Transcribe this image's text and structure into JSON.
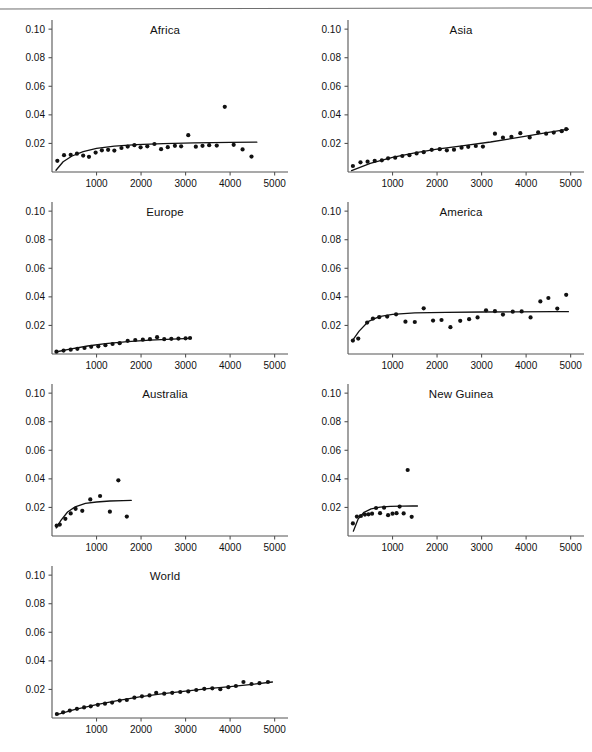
{
  "figure": {
    "layout": "2-column grid of small-multiple scatter plots, 7 panels",
    "panel_width": 296,
    "panel_height": 180
  },
  "axes": {
    "y_ticks": [
      "0.02",
      "0.04",
      "0.06",
      "0.08",
      "0.10"
    ],
    "y_tick_values": [
      0.02,
      0.04,
      0.06,
      0.08,
      0.1
    ],
    "x_ticks": [
      "1000",
      "2000",
      "3000",
      "4000",
      "5000"
    ],
    "x_tick_values": [
      1000,
      2000,
      3000,
      4000,
      5000
    ],
    "xlim": [
      0,
      5300
    ],
    "ylim": [
      0,
      0.105
    ],
    "xlabel": "",
    "ylabel": "",
    "grid": false
  },
  "style": {
    "axis_color": "#555555",
    "marker_color": "#111111",
    "curve_color": "#111111",
    "marker_size": 2.1,
    "curve_width": 1.3
  },
  "caption": {
    "text": "partially cut off at page edge"
  },
  "chart_data": [
    {
      "type": "scatter",
      "title": "Africa",
      "xlabel": "",
      "ylabel": "",
      "xlim": [
        0,
        5300
      ],
      "ylim": [
        0,
        0.105
      ],
      "grid": false,
      "legend": "none",
      "points": [
        [
          120,
          0.0078
        ],
        [
          270,
          0.0118
        ],
        [
          420,
          0.012
        ],
        [
          560,
          0.0128
        ],
        [
          700,
          0.0115
        ],
        [
          830,
          0.0106
        ],
        [
          980,
          0.0136
        ],
        [
          1120,
          0.0152
        ],
        [
          1260,
          0.0155
        ],
        [
          1400,
          0.015
        ],
        [
          1560,
          0.0168
        ],
        [
          1700,
          0.0178
        ],
        [
          1850,
          0.0188
        ],
        [
          1990,
          0.0173
        ],
        [
          2140,
          0.018
        ],
        [
          2300,
          0.0196
        ],
        [
          2450,
          0.016
        ],
        [
          2600,
          0.0174
        ],
        [
          2760,
          0.0183
        ],
        [
          2900,
          0.018
        ],
        [
          3060,
          0.0258
        ],
        [
          3230,
          0.0177
        ],
        [
          3380,
          0.0183
        ],
        [
          3530,
          0.0188
        ],
        [
          3700,
          0.0185
        ],
        [
          3880,
          0.0456
        ],
        [
          4080,
          0.019
        ],
        [
          4280,
          0.0158
        ],
        [
          4480,
          0.0108
        ]
      ],
      "curve": [
        [
          90,
          0.0012
        ],
        [
          250,
          0.0072
        ],
        [
          450,
          0.0112
        ],
        [
          700,
          0.0142
        ],
        [
          1000,
          0.0165
        ],
        [
          1400,
          0.0181
        ],
        [
          1900,
          0.0192
        ],
        [
          2500,
          0.0199
        ],
        [
          3200,
          0.0204
        ],
        [
          4000,
          0.0207
        ],
        [
          4600,
          0.0209
        ]
      ]
    },
    {
      "type": "scatter",
      "title": "Asia",
      "xlabel": "",
      "ylabel": "",
      "xlim": [
        0,
        5300
      ],
      "ylim": [
        0,
        0.105
      ],
      "grid": false,
      "legend": "none",
      "points": [
        [
          110,
          0.0042
        ],
        [
          280,
          0.0068
        ],
        [
          440,
          0.0072
        ],
        [
          600,
          0.0078
        ],
        [
          760,
          0.0082
        ],
        [
          900,
          0.0096
        ],
        [
          1060,
          0.01
        ],
        [
          1220,
          0.0112
        ],
        [
          1380,
          0.0118
        ],
        [
          1540,
          0.013
        ],
        [
          1700,
          0.0139
        ],
        [
          1880,
          0.0155
        ],
        [
          2060,
          0.016
        ],
        [
          2220,
          0.0152
        ],
        [
          2380,
          0.0156
        ],
        [
          2550,
          0.017
        ],
        [
          2700,
          0.0176
        ],
        [
          2870,
          0.0182
        ],
        [
          3030,
          0.0178
        ],
        [
          3300,
          0.0268
        ],
        [
          3480,
          0.024
        ],
        [
          3670,
          0.0246
        ],
        [
          3870,
          0.0272
        ],
        [
          4080,
          0.0242
        ],
        [
          4270,
          0.0278
        ],
        [
          4450,
          0.0268
        ],
        [
          4620,
          0.0276
        ],
        [
          4800,
          0.0286
        ],
        [
          4900,
          0.03
        ]
      ],
      "curve": [
        [
          80,
          0.001
        ],
        [
          500,
          0.006
        ],
        [
          1000,
          0.0102
        ],
        [
          1500,
          0.0134
        ],
        [
          2000,
          0.016
        ],
        [
          2600,
          0.0185
        ],
        [
          3200,
          0.021
        ],
        [
          3800,
          0.024
        ],
        [
          4400,
          0.0272
        ],
        [
          4950,
          0.03
        ]
      ]
    },
    {
      "type": "scatter",
      "title": "Europe",
      "xlabel": "",
      "ylabel": "",
      "xlim": [
        0,
        5300
      ],
      "ylim": [
        0,
        0.105
      ],
      "grid": false,
      "legend": "none",
      "points": [
        [
          100,
          0.0016
        ],
        [
          260,
          0.0024
        ],
        [
          420,
          0.003
        ],
        [
          570,
          0.0036
        ],
        [
          730,
          0.0042
        ],
        [
          880,
          0.005
        ],
        [
          1040,
          0.0054
        ],
        [
          1200,
          0.0062
        ],
        [
          1360,
          0.007
        ],
        [
          1520,
          0.0076
        ],
        [
          1700,
          0.0092
        ],
        [
          1870,
          0.0098
        ],
        [
          2040,
          0.01
        ],
        [
          2200,
          0.0104
        ],
        [
          2360,
          0.0118
        ],
        [
          2520,
          0.0104
        ],
        [
          2680,
          0.0106
        ],
        [
          2840,
          0.0108
        ],
        [
          3000,
          0.011
        ],
        [
          3100,
          0.0112
        ]
      ],
      "curve": [
        [
          80,
          0.0014
        ],
        [
          400,
          0.0034
        ],
        [
          800,
          0.0056
        ],
        [
          1200,
          0.0072
        ],
        [
          1700,
          0.0087
        ],
        [
          2200,
          0.0097
        ],
        [
          2700,
          0.0104
        ],
        [
          3100,
          0.0109
        ]
      ]
    },
    {
      "type": "scatter",
      "title": "America",
      "xlabel": "",
      "ylabel": "",
      "xlim": [
        0,
        5300
      ],
      "ylim": [
        0,
        0.105
      ],
      "grid": false,
      "legend": "none",
      "points": [
        [
          110,
          0.0094
        ],
        [
          230,
          0.0108
        ],
        [
          430,
          0.022
        ],
        [
          560,
          0.0248
        ],
        [
          700,
          0.0258
        ],
        [
          880,
          0.0262
        ],
        [
          1080,
          0.0278
        ],
        [
          1290,
          0.0226
        ],
        [
          1500,
          0.0224
        ],
        [
          1700,
          0.032
        ],
        [
          1910,
          0.0234
        ],
        [
          2100,
          0.0238
        ],
        [
          2300,
          0.0188
        ],
        [
          2520,
          0.0232
        ],
        [
          2720,
          0.0244
        ],
        [
          2910,
          0.0256
        ],
        [
          3100,
          0.0306
        ],
        [
          3300,
          0.03
        ],
        [
          3480,
          0.0276
        ],
        [
          3700,
          0.0296
        ],
        [
          3900,
          0.0298
        ],
        [
          4100,
          0.0256
        ],
        [
          4320,
          0.0368
        ],
        [
          4500,
          0.0392
        ],
        [
          4700,
          0.0318
        ],
        [
          4900,
          0.0414
        ]
      ],
      "curve": [
        [
          90,
          0.009
        ],
        [
          250,
          0.016
        ],
        [
          450,
          0.0226
        ],
        [
          700,
          0.0262
        ],
        [
          1000,
          0.0278
        ],
        [
          1500,
          0.0288
        ],
        [
          2200,
          0.0292
        ],
        [
          3000,
          0.0294
        ],
        [
          3800,
          0.0295
        ],
        [
          4600,
          0.0296
        ],
        [
          4950,
          0.0296
        ]
      ]
    },
    {
      "type": "scatter",
      "title": "Australia",
      "xlabel": "",
      "ylabel": "",
      "xlim": [
        0,
        5300
      ],
      "ylim": [
        0,
        0.105
      ],
      "grid": false,
      "legend": "none",
      "points": [
        [
          105,
          0.0072
        ],
        [
          175,
          0.008
        ],
        [
          300,
          0.012
        ],
        [
          420,
          0.0158
        ],
        [
          530,
          0.019
        ],
        [
          680,
          0.0176
        ],
        [
          860,
          0.0256
        ],
        [
          1080,
          0.028
        ],
        [
          1300,
          0.017
        ],
        [
          1490,
          0.039
        ],
        [
          1680,
          0.0136
        ]
      ],
      "curve": [
        [
          95,
          0.0056
        ],
        [
          200,
          0.011
        ],
        [
          350,
          0.0168
        ],
        [
          520,
          0.0204
        ],
        [
          750,
          0.0228
        ],
        [
          1000,
          0.0238
        ],
        [
          1300,
          0.0245
        ],
        [
          1600,
          0.0248
        ],
        [
          1780,
          0.0249
        ]
      ]
    },
    {
      "type": "scatter",
      "title": "New Guinea",
      "xlabel": "",
      "ylabel": "",
      "xlim": [
        0,
        5300
      ],
      "ylim": [
        0,
        0.105
      ],
      "grid": false,
      "legend": "none",
      "points": [
        [
          110,
          0.0088
        ],
        [
          200,
          0.0136
        ],
        [
          290,
          0.014
        ],
        [
          380,
          0.015
        ],
        [
          460,
          0.0152
        ],
        [
          540,
          0.0156
        ],
        [
          630,
          0.0196
        ],
        [
          720,
          0.016
        ],
        [
          810,
          0.0198
        ],
        [
          900,
          0.0146
        ],
        [
          1000,
          0.0156
        ],
        [
          1090,
          0.016
        ],
        [
          1160,
          0.0206
        ],
        [
          1250,
          0.0158
        ],
        [
          1340,
          0.0462
        ],
        [
          1430,
          0.0134
        ]
      ],
      "curve": [
        [
          120,
          0.0034
        ],
        [
          230,
          0.012
        ],
        [
          360,
          0.0166
        ],
        [
          520,
          0.019
        ],
        [
          720,
          0.0202
        ],
        [
          950,
          0.0207
        ],
        [
          1200,
          0.0209
        ],
        [
          1450,
          0.021
        ],
        [
          1560,
          0.021
        ]
      ]
    },
    {
      "type": "scatter",
      "title": "World",
      "xlabel": "",
      "ylabel": "",
      "xlim": [
        0,
        5300
      ],
      "ylim": [
        0,
        0.105
      ],
      "grid": false,
      "legend": "none",
      "points": [
        [
          110,
          0.0028
        ],
        [
          250,
          0.004
        ],
        [
          400,
          0.0052
        ],
        [
          560,
          0.0064
        ],
        [
          720,
          0.0074
        ],
        [
          870,
          0.0082
        ],
        [
          1030,
          0.0092
        ],
        [
          1190,
          0.01
        ],
        [
          1350,
          0.0108
        ],
        [
          1520,
          0.0122
        ],
        [
          1680,
          0.0126
        ],
        [
          1850,
          0.0142
        ],
        [
          2020,
          0.0152
        ],
        [
          2190,
          0.0158
        ],
        [
          2340,
          0.0176
        ],
        [
          2520,
          0.017
        ],
        [
          2700,
          0.0176
        ],
        [
          2880,
          0.0182
        ],
        [
          3060,
          0.0186
        ],
        [
          3240,
          0.0196
        ],
        [
          3420,
          0.0204
        ],
        [
          3600,
          0.0208
        ],
        [
          3780,
          0.0202
        ],
        [
          3960,
          0.0216
        ],
        [
          4130,
          0.0224
        ],
        [
          4300,
          0.0252
        ],
        [
          4480,
          0.0238
        ],
        [
          4660,
          0.0244
        ],
        [
          4850,
          0.0252
        ]
      ],
      "curve": [
        [
          90,
          0.0022
        ],
        [
          500,
          0.0058
        ],
        [
          1000,
          0.0094
        ],
        [
          1500,
          0.0124
        ],
        [
          2000,
          0.015
        ],
        [
          2500,
          0.017
        ],
        [
          3000,
          0.0188
        ],
        [
          3500,
          0.0205
        ],
        [
          4000,
          0.022
        ],
        [
          4500,
          0.0236
        ],
        [
          4950,
          0.0252
        ]
      ]
    }
  ]
}
